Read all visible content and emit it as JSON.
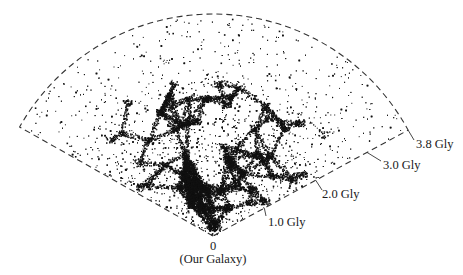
{
  "figure": {
    "type": "galaxy-redshift-survey-wedge",
    "origin_label_value": "0",
    "origin_label_text": "(Our Galaxy)",
    "distance_labels": [
      {
        "id": "d1",
        "text": "1.0 Gly",
        "value_gly": 1.0
      },
      {
        "id": "d2",
        "text": "2.0 Gly",
        "value_gly": 2.0
      },
      {
        "id": "d3",
        "text": "3.0 Gly",
        "value_gly": 3.0
      },
      {
        "id": "d4",
        "text": "3.8 Gly",
        "value_gly": 3.8
      }
    ],
    "colors": {
      "background": "#ffffff",
      "points": "#111111",
      "outline": "#333333",
      "text": "#1a1a1a"
    }
  },
  "chart_data": {
    "type": "scatter",
    "title": "",
    "xlabel": "",
    "ylabel": "",
    "radial_axis": {
      "unit": "Gly",
      "origin": "0 (Our Galaxy)",
      "ticks": [
        1.0,
        2.0,
        3.0,
        3.8
      ],
      "tick_labels": [
        "1.0 Gly",
        "2.0 Gly",
        "3.0 Gly",
        "3.8 Gly"
      ],
      "range": [
        0,
        3.8
      ]
    },
    "angular_extent_deg": 122,
    "density_profile": "dense filamentary web out to ~2.5 Gly, sparse points toward 3.8 Gly",
    "grid": false,
    "legend": null
  }
}
